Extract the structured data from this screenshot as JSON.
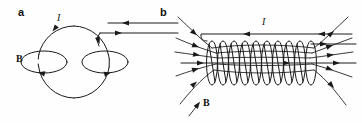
{
  "figure": {
    "background_color": "#fefefe",
    "ink_color": "#1a1a1a",
    "width": 362,
    "height": 123
  },
  "panels": [
    {
      "id": "a",
      "letter": "a",
      "letter_x": 18,
      "letter_y": 16,
      "description": "single circular current loop with magnetic field lines encircling the wire",
      "labels": {
        "current": "I",
        "current_x": 57,
        "current_y": 21,
        "field": "B",
        "field_x": 16,
        "field_y": 62
      },
      "loop": {
        "cx": 74,
        "cy": 62,
        "r": 36
      },
      "field_ellipses": [
        {
          "cx": 44,
          "cy": 62,
          "rx": 23,
          "ry": 11,
          "arrow_direction": "counterclockwise"
        },
        {
          "cx": 105,
          "cy": 62,
          "rx": 23,
          "ry": 11,
          "arrow_direction": "clockwise"
        }
      ],
      "lead_wires": [
        {
          "y": 23,
          "x_start": 108,
          "x_end": 178,
          "arrow_direction": "left"
        },
        {
          "y": 33,
          "x_start": 100,
          "x_end": 178,
          "arrow_direction": "right"
        }
      ]
    },
    {
      "id": "b",
      "letter": "b",
      "letter_x": 160,
      "letter_y": 16,
      "description": "solenoid of many turns with magnetic field lines dense inside and fanning out at both ends",
      "labels": {
        "current": "I",
        "current_x": 262,
        "current_y": 25,
        "field": "B",
        "field_x": 203,
        "field_y": 106
      },
      "coil": {
        "x_start": 207,
        "x_end": 320,
        "cy": 63,
        "turns": 10,
        "turn_width": 11,
        "turn_height": 44
      },
      "lead_wires": [
        {
          "y": 34,
          "x_start": 201,
          "x_end": 352,
          "arrow_direction": "left"
        },
        {
          "y": 44,
          "x_start": 313,
          "x_end": 356,
          "arrow_direction": "right"
        }
      ],
      "axis_line": {
        "y": 63,
        "x_start": 181,
        "x_end": 356,
        "arrow_direction": "right"
      },
      "field_line_count": 7
    }
  ]
}
